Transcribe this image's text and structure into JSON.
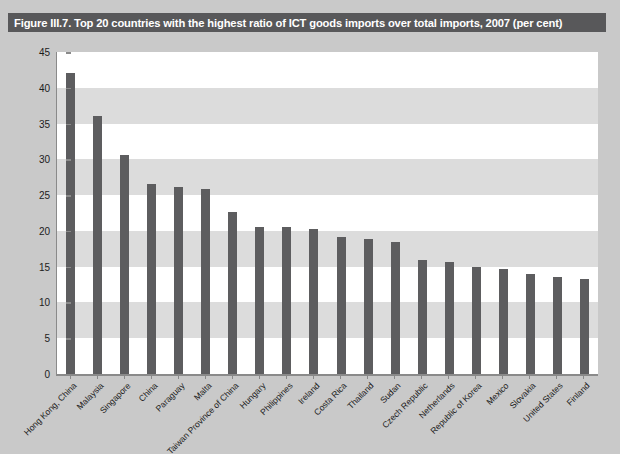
{
  "figure": {
    "title": "Figure III.7. Top 20 countries with the highest ratio of ICT goods imports over total imports, 2007 (per cent)",
    "title_bar_color": "#58585a",
    "bar_color": "#5d5d5f",
    "band_color": "#dcdcdc",
    "panel_background": "#c9c9c9",
    "plot_background": "#ffffff"
  },
  "chart_data": {
    "type": "bar",
    "title": "Figure III.7. Top 20 countries with the highest ratio of ICT goods imports over total imports, 2007 (per cent)",
    "xlabel": "",
    "ylabel": "",
    "ylim": [
      0,
      45
    ],
    "yticks": [
      0,
      5,
      10,
      15,
      20,
      25,
      30,
      35,
      40,
      45
    ],
    "ytick_labels": [
      "0",
      "5",
      "10",
      "15",
      "20",
      "25",
      "30",
      "35",
      "40",
      "45"
    ],
    "grid": "horizontal-bands",
    "legend": null,
    "units": "per cent",
    "categories": [
      "Hong Kong, China",
      "Malaysia",
      "Singapore",
      "China",
      "Paraguay",
      "Malta",
      "Taiwan Province of China",
      "Hungary",
      "Philippines",
      "Ireland",
      "Costa Rica",
      "Thailand",
      "Sudan",
      "Czech Republic",
      "Netherlands",
      "Republic of Korea",
      "Mexico",
      "Slovakia",
      "United States",
      "Finland"
    ],
    "values": [
      42.0,
      36.0,
      30.6,
      26.6,
      26.1,
      25.8,
      22.6,
      20.6,
      20.6,
      20.3,
      19.2,
      18.8,
      18.4,
      15.9,
      15.6,
      15.0,
      14.7,
      14.0,
      13.5,
      13.3
    ]
  }
}
